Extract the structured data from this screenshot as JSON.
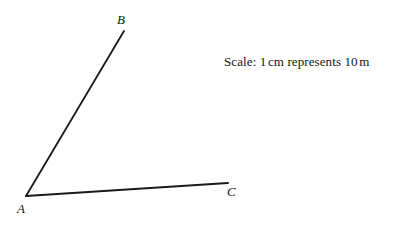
{
  "figure": {
    "background_color": "#ffffff",
    "stroke_color": "#1a1a1a",
    "text_color": "#141414",
    "width": 400,
    "height": 231
  },
  "labels": {
    "vertex_a": "A",
    "vertex_b": "B",
    "vertex_c": "C"
  },
  "annotation": {
    "scale_prefix": "Scale:",
    "scale_value": "1",
    "scale_unit": "cm",
    "scale_verb": "represents",
    "scale_target_value": "10",
    "scale_target_unit": "m",
    "scale_full_text": "Scale: 1 cm represents 10 m"
  },
  "geometry": {
    "type": "angle",
    "vertex": "A",
    "rays": [
      {
        "name": "ray-ab",
        "from": "A",
        "to": "B",
        "x1": 26,
        "y1": 196,
        "x2": 124,
        "y2": 31
      },
      {
        "name": "ray-ac",
        "from": "A",
        "to": "C",
        "x1": 26,
        "y1": 196,
        "x2": 228,
        "y2": 183
      }
    ],
    "stroke_width": 1.8
  }
}
